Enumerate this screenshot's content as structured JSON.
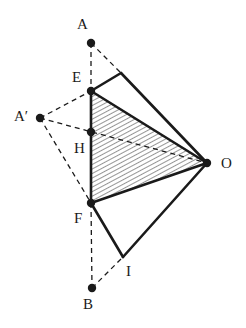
{
  "figure": {
    "type": "plane-geometry-diagram",
    "width": 246,
    "height": 328,
    "background_color": "#ffffff",
    "stroke_color": "#1a1a1a",
    "hatch_color": "#2b2b2b",
    "solid_stroke_width": 2.6,
    "thin_stroke_width": 1.3,
    "dash_pattern": "5,4",
    "dot_radius": 4.2
  },
  "points": [
    {
      "id": "A",
      "label": "A",
      "x": 91,
      "y": 43,
      "dot": true,
      "label_x": 77,
      "label_y": 26
    },
    {
      "id": "E",
      "label": "E",
      "x": 91,
      "y": 91,
      "dot": true,
      "label_x": 72,
      "label_y": 79
    },
    {
      "id": "Ap",
      "label": "A′",
      "x": 40,
      "y": 118,
      "dot": true,
      "label_x": 14,
      "label_y": 118
    },
    {
      "id": "H",
      "label": "H",
      "x": 91,
      "y": 132,
      "dot": true,
      "label_x": 74,
      "label_y": 150
    },
    {
      "id": "F",
      "label": "F",
      "x": 91,
      "y": 203,
      "dot": true,
      "label_x": 74,
      "label_y": 220
    },
    {
      "id": "O",
      "label": "O",
      "x": 207,
      "y": 163,
      "dot": true,
      "label_x": 221,
      "label_y": 165
    },
    {
      "id": "I",
      "label": "I",
      "x": 123,
      "y": 257,
      "dot": false,
      "label_x": 126,
      "label_y": 273
    },
    {
      "id": "B",
      "label": "B",
      "x": 92,
      "y": 288,
      "dot": true,
      "label_x": 83,
      "label_y": 306
    },
    {
      "id": "K",
      "label": "",
      "x": 121,
      "y": 73,
      "dot": false,
      "label_x": 0,
      "label_y": 0
    }
  ],
  "solid_segments": [
    {
      "name": "segment-E-K",
      "from": "E",
      "to": "K"
    },
    {
      "name": "segment-K-O",
      "from": "K",
      "to": "O"
    },
    {
      "name": "segment-E-F",
      "from": "E",
      "to": "F"
    },
    {
      "name": "segment-E-O",
      "from": "E",
      "to": "O"
    },
    {
      "name": "segment-F-O",
      "from": "F",
      "to": "O"
    },
    {
      "name": "segment-F-I",
      "from": "F",
      "to": "I"
    },
    {
      "name": "segment-I-O",
      "from": "I",
      "to": "O"
    }
  ],
  "dashed_segments": [
    {
      "name": "segment-A-E",
      "from": "A",
      "to": "E"
    },
    {
      "name": "segment-A-K",
      "from": "A",
      "to": "K"
    },
    {
      "name": "segment-Ap-E",
      "from": "Ap",
      "to": "E"
    },
    {
      "name": "segment-Ap-O",
      "from": "Ap",
      "to": "O"
    },
    {
      "name": "segment-Ap-F",
      "from": "Ap",
      "to": "F"
    },
    {
      "name": "segment-F-B",
      "from": "F",
      "to": "B"
    },
    {
      "name": "segment-B-I",
      "from": "B",
      "to": "I"
    }
  ],
  "hatched_region": {
    "name": "triangle-E-F-O",
    "vertices": [
      "E",
      "F",
      "O"
    ],
    "hatch_angle_deg": 62,
    "hatch_spacing_px": 4
  }
}
